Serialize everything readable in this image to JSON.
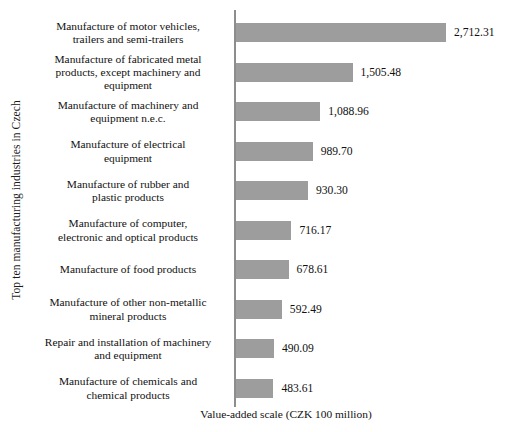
{
  "chart_data": {
    "type": "bar",
    "orientation": "horizontal",
    "title": "",
    "xlabel": "Value-added scale (CZK 100 million)",
    "ylabel": "Top ten manufacturing industries in Czech",
    "categories": [
      "Manufacture of motor vehicles, trailers and semi-trailers",
      "Manufacture of fabricated metal products, except machinery and equipment",
      "Manufacture of machinery and equipment n.e.c.",
      "Manufacture of electrical equipment",
      "Manufacture of rubber and plastic products",
      "Manufacture of computer, electronic and optical products",
      "Manufacture of food products",
      "Manufacture of other non-metallic mineral products",
      "Repair and installation of machinery and equipment",
      "Manufacture of chemicals and chemical products"
    ],
    "values": [
      2712.31,
      1505.48,
      1088.96,
      989.7,
      930.3,
      716.17,
      678.61,
      592.49,
      490.09,
      483.61
    ],
    "value_labels": [
      "2,712.31",
      "1,505.48",
      "1,088.96",
      "989.70",
      "930.30",
      "716.17",
      "678.61",
      "592.49",
      "490.09",
      "483.61"
    ],
    "xlim": [
      0,
      2712.31
    ],
    "grid": false,
    "legend": false,
    "bar_color": "#9d9d9d",
    "axis_color": "#8d8d8d"
  },
  "bars": [
    {
      "label_line1": "Manufacture of motor vehicles,",
      "label_line2": "trailers and semi-trailers",
      "label_line3": "",
      "value_label": "2,712.31",
      "value": 2712.31
    },
    {
      "label_line1": "Manufacture of fabricated metal",
      "label_line2": "products, except machinery and",
      "label_line3": "equipment",
      "value_label": "1,505.48",
      "value": 1505.48
    },
    {
      "label_line1": "Manufacture of machinery and",
      "label_line2": "equipment n.e.c.",
      "label_line3": "",
      "value_label": "1,088.96",
      "value": 1088.96
    },
    {
      "label_line1": "Manufacture of electrical",
      "label_line2": "equipment",
      "label_line3": "",
      "value_label": "989.70",
      "value": 989.7
    },
    {
      "label_line1": "Manufacture of rubber and",
      "label_line2": "plastic products",
      "label_line3": "",
      "value_label": "930.30",
      "value": 930.3
    },
    {
      "label_line1": "Manufacture of computer,",
      "label_line2": "electronic and optical products",
      "label_line3": "",
      "value_label": "716.17",
      "value": 716.17
    },
    {
      "label_line1": "Manufacture of food products",
      "label_line2": "",
      "label_line3": "",
      "value_label": "678.61",
      "value": 678.61
    },
    {
      "label_line1": "Manufacture of other non-metallic",
      "label_line2": "mineral products",
      "label_line3": "",
      "value_label": "592.49",
      "value": 592.49
    },
    {
      "label_line1": "Repair and installation of machinery",
      "label_line2": "and equipment",
      "label_line3": "",
      "value_label": "490.09",
      "value": 490.09
    },
    {
      "label_line1": "Manufacture of chemicals and",
      "label_line2": "chemical products",
      "label_line3": "",
      "value_label": "483.61",
      "value": 483.61
    }
  ],
  "axes": {
    "y_title": "Top ten manufacturing industries in Czech",
    "x_title": "Value-added scale (CZK 100 million)"
  }
}
